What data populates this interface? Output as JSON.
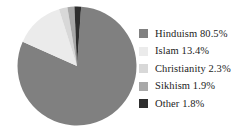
{
  "chart_data": {
    "type": "pie",
    "title": "",
    "categories": [
      "Hinduism",
      "Islam",
      "Christianity",
      "Sikhism",
      "Other"
    ],
    "values": [
      80.5,
      13.4,
      2.3,
      1.9,
      1.8
    ],
    "value_suffix": "%",
    "start_angle_deg": 0,
    "direction": "clockwise",
    "legend_position": "right",
    "grid": false,
    "slices": [
      {
        "label": "Hinduism",
        "value": 80.5,
        "text": "Hinduism 80.5%",
        "color": "#808080"
      },
      {
        "label": "Islam",
        "value": 13.4,
        "text": "Islam 13.4%",
        "color": "#ebebeb"
      },
      {
        "label": "Christianity",
        "value": 2.3,
        "text": "Christianity 2.3%",
        "color": "#d8d8d8"
      },
      {
        "label": "Sikhism",
        "value": 1.9,
        "text": "Sikhism 1.9%",
        "color": "#a8a8a8"
      },
      {
        "label": "Other",
        "value": 1.8,
        "text": "Other 1.8%",
        "color": "#2e2e2e"
      }
    ]
  },
  "legend": {
    "items": [
      {
        "text": "Hinduism 80.5%",
        "color": "#808080"
      },
      {
        "text": "Islam 13.4%",
        "color": "#ebebeb"
      },
      {
        "text": "Christianity 2.3%",
        "color": "#d8d8d8"
      },
      {
        "text": "Sikhism 1.9%",
        "color": "#a8a8a8"
      },
      {
        "text": "Other 1.8%",
        "color": "#2e2e2e"
      }
    ]
  },
  "colors": {
    "background": "#ffffff",
    "text": "#232323",
    "slice_hinduism": "#808080",
    "slice_islam": "#ebebeb",
    "slice_christianity": "#d8d8d8",
    "slice_sikhism": "#a8a8a8",
    "slice_other": "#2e2e2e"
  }
}
